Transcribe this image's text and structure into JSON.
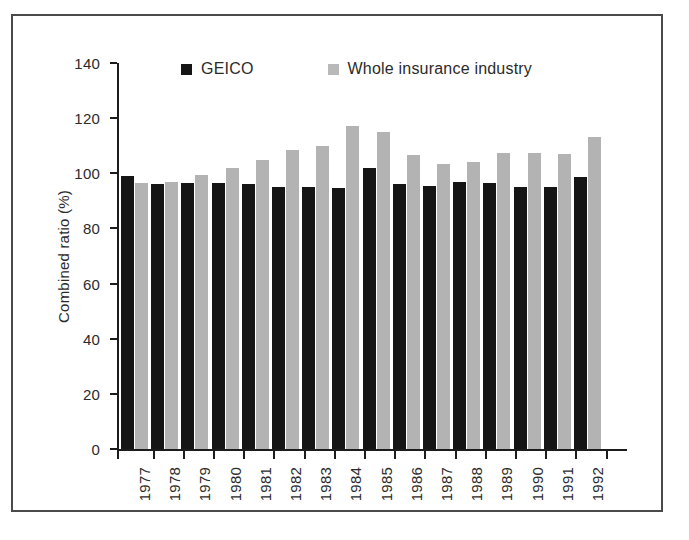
{
  "chart_data": {
    "type": "bar",
    "title": "",
    "subtitle": "",
    "xlabel": "",
    "ylabel": "Combined ratio (%)",
    "ylim": [
      0,
      140
    ],
    "ytick_step": 20,
    "yticks": [
      0,
      20,
      40,
      60,
      80,
      100,
      120,
      140
    ],
    "ytick_labels": [
      "0",
      "20",
      "40",
      "60",
      "80",
      "100",
      "120",
      "140"
    ],
    "grid": false,
    "legend_position": "top-center",
    "categories": [
      "1977",
      "1978",
      "1979",
      "1980",
      "1981",
      "1982",
      "1983",
      "1984",
      "1985",
      "1986",
      "1987",
      "1988",
      "1989",
      "1990",
      "1991",
      "1992"
    ],
    "series": [
      {
        "name": "GEICO",
        "color": "#151515",
        "values": [
          99,
          96,
          96.5,
          96.5,
          96,
          95,
          95,
          94.5,
          102,
          96,
          95.5,
          97,
          96.5,
          95,
          95,
          98.5
        ]
      },
      {
        "name": "Whole insurance industry",
        "color": "#b3b3b3",
        "values": [
          96.5,
          97,
          99.5,
          102,
          105,
          108.5,
          110,
          117,
          115,
          106.5,
          103.5,
          104,
          107.5,
          107.5,
          107,
          113
        ]
      }
    ]
  },
  "legend": {
    "items": [
      {
        "label": "GEICO",
        "swatch": "geico"
      },
      {
        "label": "Whole insurance industry",
        "swatch": "industry"
      }
    ]
  },
  "axes": {
    "y_title": "Combined ratio (%)"
  }
}
